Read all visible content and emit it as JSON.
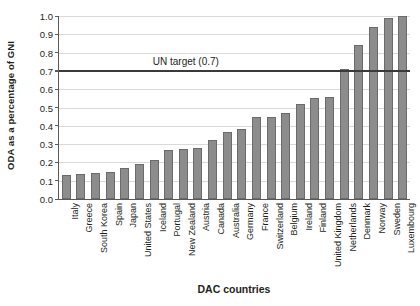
{
  "chart_data": {
    "type": "bar",
    "title": "",
    "xlabel": "DAC countries",
    "ylabel": "ODA as a percentage of GNI",
    "ylim": [
      0.0,
      1.0
    ],
    "ytick_labels": [
      "0.0",
      "0.1",
      "0.2",
      "0.3",
      "0.4",
      "0.5",
      "0.6",
      "0.7",
      "0.8",
      "0.9",
      "1.0"
    ],
    "ytick_values": [
      0.0,
      0.1,
      0.2,
      0.3,
      0.4,
      0.5,
      0.6,
      0.7,
      0.8,
      0.9,
      1.0
    ],
    "grid": true,
    "legend": "none",
    "bar_color": "#8c8c8c",
    "bar_edge_color": "#6b6b6b",
    "categories": [
      "Italy",
      "Greece",
      "South Korea",
      "Spain",
      "Japan",
      "United States",
      "Iceland",
      "Portugal",
      "New Zealand",
      "Austria",
      "Canada",
      "Australia",
      "Germany",
      "France",
      "Switzerland",
      "Belgium",
      "Ireland",
      "Finland",
      "United Kingdom",
      "Netherlands",
      "Denmark",
      "Norway",
      "Sweden",
      "Luxembourg"
    ],
    "values": [
      0.13,
      0.135,
      0.14,
      0.145,
      0.17,
      0.19,
      0.215,
      0.27,
      0.275,
      0.28,
      0.32,
      0.365,
      0.38,
      0.45,
      0.45,
      0.47,
      0.52,
      0.55,
      0.56,
      0.71,
      0.84,
      0.94,
      0.99,
      1.0
    ],
    "annotations": [
      {
        "name": "un-target",
        "label": "UN target (0.7)",
        "value": 0.7,
        "color": "#3a3a3a"
      }
    ]
  }
}
